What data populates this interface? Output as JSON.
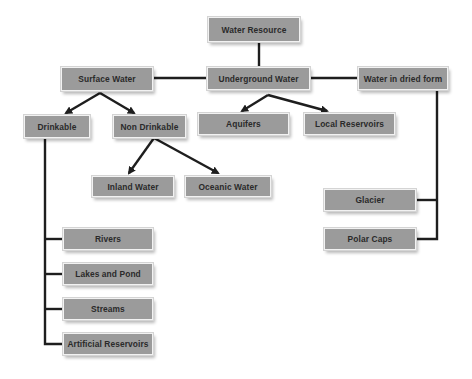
{
  "diagram": {
    "type": "hierarchy",
    "colors": {
      "node_fill": "#9b9b9b",
      "node_text": "#2a2a2a",
      "connector": "#1e1e1e"
    },
    "root": {
      "label": "Water Resource"
    },
    "level1": [
      {
        "id": "surface",
        "label": "Surface Water"
      },
      {
        "id": "underground",
        "label": "Underground Water"
      },
      {
        "id": "dried",
        "label": "Water in dried form"
      }
    ],
    "surface_children": [
      {
        "id": "drinkable",
        "label": "Drinkable"
      },
      {
        "id": "non_drinkable",
        "label": "Non Drinkable"
      }
    ],
    "underground_children": [
      {
        "id": "aquifers",
        "label": "Aquifers"
      },
      {
        "id": "local_reservoirs",
        "label": "Local Reservoirs"
      }
    ],
    "non_drinkable_children": [
      {
        "id": "inland",
        "label": "Inland Water"
      },
      {
        "id": "oceanic",
        "label": "Oceanic Water"
      }
    ],
    "dried_children": [
      {
        "id": "glacier",
        "label": "Glacier"
      },
      {
        "id": "polar_caps",
        "label": "Polar Caps"
      }
    ],
    "drinkable_children": [
      {
        "id": "rivers",
        "label": "Rivers"
      },
      {
        "id": "lakes",
        "label": "Lakes and Pond"
      },
      {
        "id": "streams",
        "label": "Streams"
      },
      {
        "id": "artificial",
        "label": "Artificial Reservoirs"
      }
    ]
  }
}
